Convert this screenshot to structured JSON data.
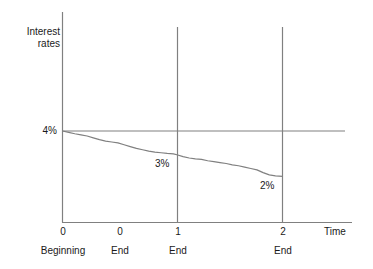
{
  "figure": {
    "background": "#ffffff",
    "line_color": "#808080",
    "text_color": "#1a1a1a"
  },
  "axes": {
    "y_label": "Interest\nrates",
    "x_label": "Time",
    "y_tick_label": "4%"
  },
  "annotations": {
    "mid": "3%",
    "end": "2%"
  },
  "x_ticks": [
    {
      "value": "0",
      "sub": "Beginning"
    },
    {
      "value": "0",
      "sub": "End"
    },
    {
      "value": "1",
      "sub": "End"
    },
    {
      "value": "2",
      "sub": "End"
    }
  ],
  "chart_data": {
    "type": "line",
    "title": "",
    "subtitle": "",
    "xlabel": "Time",
    "ylabel": "Interest rates",
    "grid": false,
    "legend": null,
    "xlim": [
      0,
      2.6
    ],
    "ylim": [
      0,
      4.6
    ],
    "x_tick_values": [
      0,
      0.65,
      1.3,
      2.5
    ],
    "x_tick_labels": [
      "0",
      "0",
      "1",
      "2"
    ],
    "x_tick_sublabels": [
      "Beginning",
      "End",
      "End",
      "End"
    ],
    "y_tick_values": [
      4
    ],
    "y_tick_labels": [
      "4%"
    ],
    "reference_lines": [
      {
        "orientation": "horizontal",
        "value": 4,
        "label": "4%"
      },
      {
        "orientation": "vertical",
        "value": 1.3,
        "label": "1 End"
      },
      {
        "orientation": "vertical",
        "value": 2.5,
        "label": "2 End"
      }
    ],
    "annotations": [
      {
        "text": "3%",
        "x": 1.18,
        "y": 3.0
      },
      {
        "text": "2%",
        "x": 2.32,
        "y": 2.05
      }
    ],
    "series": [
      {
        "name": "Interest rates",
        "color": "#808080",
        "x": [
          0.0,
          0.07,
          0.14,
          0.21,
          0.28,
          0.35,
          0.42,
          0.49,
          0.56,
          0.63,
          0.7,
          0.77,
          0.84,
          0.91,
          0.98,
          1.05,
          1.12,
          1.19,
          1.26,
          1.3,
          1.37,
          1.44,
          1.51,
          1.58,
          1.65,
          1.72,
          1.79,
          1.86,
          1.93,
          2.0,
          2.07,
          2.14,
          2.21,
          2.28,
          2.35,
          2.42,
          2.5
        ],
        "y": [
          4.0,
          3.94,
          3.88,
          3.83,
          3.78,
          3.7,
          3.62,
          3.56,
          3.52,
          3.48,
          3.4,
          3.32,
          3.24,
          3.18,
          3.12,
          3.08,
          3.05,
          3.02,
          3.0,
          2.96,
          2.88,
          2.82,
          2.78,
          2.76,
          2.7,
          2.66,
          2.62,
          2.58,
          2.52,
          2.48,
          2.42,
          2.36,
          2.3,
          2.18,
          2.08,
          2.04,
          2.02
        ]
      }
    ]
  }
}
